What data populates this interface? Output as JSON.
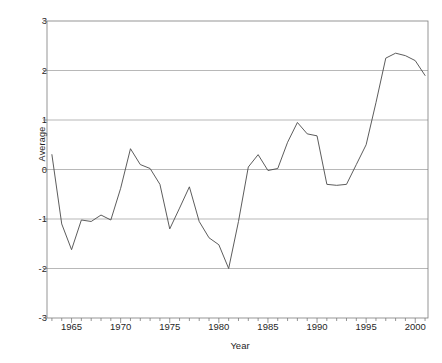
{
  "chart_data": {
    "type": "line",
    "title": "",
    "title_clipped_note": "",
    "xlabel": "Year",
    "ylabel": "Average",
    "xlim": [
      1962.5,
      2001.3
    ],
    "ylim": [
      -3,
      3
    ],
    "xticks": [
      1965,
      1970,
      1975,
      1980,
      1985,
      1990,
      1995,
      2000
    ],
    "xtick_labels": [
      "1965",
      "1970",
      "1975",
      "1980",
      "1985",
      "1990",
      "1995",
      "2000"
    ],
    "minor_xtick_interval": 1,
    "yticks": [
      -3,
      -2,
      -1,
      0,
      1,
      2,
      3
    ],
    "ytick_labels": [
      "-3",
      "-2",
      "-1",
      "0",
      "1",
      "2",
      "3"
    ],
    "grid": "horizontal",
    "grid_color": "#9a9a9a",
    "line_color": "#4a4a4a",
    "line_width": 0.9,
    "background": "#ffffff",
    "frame_color": "#7c7c7c",
    "legend": null,
    "series": [
      {
        "name": "Average",
        "x": [
          1963,
          1964,
          1965,
          1966,
          1967,
          1968,
          1969,
          1970,
          1971,
          1972,
          1973,
          1974,
          1975,
          1976,
          1977,
          1978,
          1979,
          1980,
          1981,
          1982,
          1983,
          1984,
          1985,
          1986,
          1987,
          1988,
          1989,
          1990,
          1991,
          1992,
          1993,
          1994,
          1995,
          1996,
          1997,
          1998,
          1999,
          2000,
          2001
        ],
        "values": [
          0.3,
          -1.1,
          -1.62,
          -1.02,
          -1.05,
          -0.92,
          -1.02,
          -0.38,
          0.42,
          0.1,
          0.02,
          -0.3,
          -1.2,
          -0.78,
          -0.35,
          -1.05,
          -1.38,
          -1.52,
          -2.0,
          -1.05,
          0.05,
          0.3,
          -0.02,
          0.02,
          0.55,
          0.95,
          0.72,
          0.68,
          -0.3,
          -0.32,
          -0.3,
          0.1,
          0.5,
          1.35,
          2.25,
          2.35,
          2.3,
          2.2,
          1.9
        ]
      }
    ]
  },
  "axes": {
    "y_title": "Average",
    "x_title": "Year"
  }
}
